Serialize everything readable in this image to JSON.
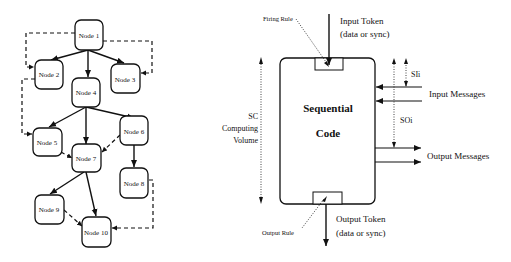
{
  "left_diagram": {
    "nodes": [
      {
        "id": "n1",
        "label": "Node 1"
      },
      {
        "id": "n2",
        "label": "Node 2"
      },
      {
        "id": "n3",
        "label": "Node 3"
      },
      {
        "id": "n4",
        "label": "Node 4"
      },
      {
        "id": "n5",
        "label": "Node 5"
      },
      {
        "id": "n6",
        "label": "Node 6"
      },
      {
        "id": "n7",
        "label": "Node 7"
      },
      {
        "id": "n8",
        "label": "Node 8"
      },
      {
        "id": "n9",
        "label": "Node 9"
      },
      {
        "id": "n10",
        "label": "Node 10"
      }
    ],
    "edges_solid": [
      [
        "n1",
        "n2"
      ],
      [
        "n1",
        "n4"
      ],
      [
        "n1",
        "n3"
      ],
      [
        "n4",
        "n5"
      ],
      [
        "n4",
        "n7"
      ],
      [
        "n4",
        "n6"
      ],
      [
        "n6",
        "n8"
      ],
      [
        "n7",
        "n9"
      ],
      [
        "n7",
        "n10"
      ]
    ],
    "edges_dashed": [
      [
        "n1",
        "n2"
      ],
      [
        "n1",
        "n3"
      ],
      [
        "n2",
        "n5"
      ],
      [
        "n5",
        "n7"
      ],
      [
        "n6",
        "n7"
      ],
      [
        "n9",
        "n10"
      ],
      [
        "n8",
        "n10"
      ]
    ]
  },
  "right_diagram": {
    "box_title_line1": "Sequential",
    "box_title_line2": "Code",
    "firing_rule": "Firing Rule",
    "output_rule": "Output Rule",
    "input_token_line1": "Input Token",
    "input_token_line2": "(data or sync)",
    "output_token_line1": "Output Token",
    "output_token_line2": "(data or sync)",
    "input_messages": "Input Messages",
    "output_messages": "Output Messages",
    "sli": "SIi",
    "soi": "SOi",
    "sc_line1": "SC",
    "sc_line2": "Computing",
    "sc_line3": "Volume"
  }
}
